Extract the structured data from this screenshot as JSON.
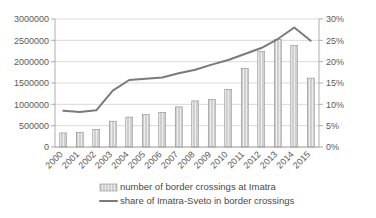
{
  "chart_data": {
    "type": "bar",
    "title": "",
    "subtitle": "",
    "xlabel": "",
    "ylabel": "",
    "categories": [
      "2000",
      "2001",
      "2002",
      "2003",
      "2004",
      "2005",
      "2006",
      "2007",
      "2008",
      "2009",
      "2010",
      "2011",
      "2012",
      "2013",
      "2014",
      "2015"
    ],
    "series": [
      {
        "name": "number of border crossings at Imatra",
        "type": "bar",
        "axis": "left",
        "color": "#bfbfbf",
        "values": [
          330000,
          345000,
          415000,
          605000,
          700000,
          765000,
          810000,
          940000,
          1080000,
          1110000,
          1345000,
          1845000,
          2245000,
          2520000,
          2375000,
          1615000
        ]
      },
      {
        "name": "share of Imatra-Sveto in border crossings",
        "type": "line",
        "axis": "right",
        "color": "#808080",
        "values": [
          8.5,
          8.2,
          8.6,
          13.2,
          15.7,
          16.0,
          16.3,
          17.3,
          18.1,
          19.3,
          20.4,
          21.8,
          23.2,
          25.3,
          28.0,
          24.9
        ]
      }
    ],
    "left_axis": {
      "ticks": [
        "0",
        "500000",
        "1000000",
        "1500000",
        "2000000",
        "2500000",
        "3000000"
      ],
      "min": 0,
      "max": 3000000,
      "step": 500000
    },
    "right_axis": {
      "ticks": [
        "0%",
        "5%",
        "10%",
        "15%",
        "20%",
        "25%",
        "30%"
      ],
      "min": 0,
      "max": 30,
      "step": 5,
      "unit": "%"
    },
    "grid": true,
    "legend_position": "bottom",
    "legend": [
      {
        "label": "number of border crossings at Imatra",
        "marker": "bar-swatch"
      },
      {
        "label": "share of Imatra-Sveto in border crossings",
        "marker": "line-swatch"
      }
    ]
  }
}
